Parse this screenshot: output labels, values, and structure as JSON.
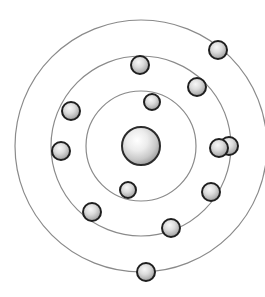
{
  "figure": {
    "background_color": "#ffffff",
    "width": 265,
    "height": 297
  },
  "nucleus": {
    "label": "nucleus",
    "cx": 141,
    "cy": 146,
    "r": 19,
    "fill_center_color": "#ffffff",
    "fill_mid_color": "#d9d9d9",
    "fill_edge_color": "#8f8f8f",
    "stroke_color": "#2b2b2b",
    "stroke_width": 2
  },
  "shells": [
    {
      "name": "inner-shell",
      "index": 1,
      "cx": 141,
      "cy": 146,
      "r": 55,
      "electron_count": 2,
      "stroke_color": "#8a8a8a",
      "stroke_width": 1.2
    },
    {
      "name": "middle-shell",
      "index": 2,
      "cx": 141,
      "cy": 146,
      "r": 90,
      "electron_count": 6,
      "stroke_color": "#8a8a8a",
      "stroke_width": 1.2
    },
    {
      "name": "outer-shell",
      "index": 3,
      "cx": 141,
      "cy": 146,
      "r": 126,
      "electron_count": 5,
      "stroke_color": "#8a8a8a",
      "stroke_width": 1.2
    }
  ],
  "electron_style": {
    "fill_center_color": "#f2f2f2",
    "fill_mid_color": "#c6c6c6",
    "fill_edge_color": "#7d7d7d",
    "stroke_color": "#1f1f1f",
    "stroke_width": 2
  },
  "electrons": [
    {
      "name": "electron-inner-1",
      "shell": 1,
      "cx": 152,
      "cy": 102,
      "r": 8
    },
    {
      "name": "electron-inner-2",
      "shell": 1,
      "cx": 128,
      "cy": 190,
      "r": 8
    },
    {
      "name": "electron-middle-1",
      "shell": 2,
      "cx": 140,
      "cy": 65,
      "r": 9
    },
    {
      "name": "electron-middle-2",
      "shell": 2,
      "cx": 197,
      "cy": 87,
      "r": 9
    },
    {
      "name": "electron-middle-3",
      "shell": 2,
      "cx": 171,
      "cy": 228,
      "r": 9
    },
    {
      "name": "electron-middle-4",
      "shell": 2,
      "cx": 92,
      "cy": 212,
      "r": 9
    },
    {
      "name": "electron-middle-5",
      "shell": 2,
      "cx": 71,
      "cy": 111,
      "r": 9
    },
    {
      "name": "electron-middle-6",
      "shell": 2,
      "cx": 229,
      "cy": 146,
      "r": 9
    },
    {
      "name": "electron-outer-1",
      "shell": 3,
      "cx": 218,
      "cy": 50,
      "r": 9
    },
    {
      "name": "electron-outer-2",
      "shell": 3,
      "cx": 219,
      "cy": 148,
      "r": 9
    },
    {
      "name": "electron-outer-3",
      "shell": 3,
      "cx": 211,
      "cy": 192,
      "r": 9
    },
    {
      "name": "electron-outer-4",
      "shell": 3,
      "cx": 146,
      "cy": 272,
      "r": 9
    },
    {
      "name": "electron-outer-5",
      "shell": 3,
      "cx": 61,
      "cy": 151,
      "r": 9
    }
  ]
}
